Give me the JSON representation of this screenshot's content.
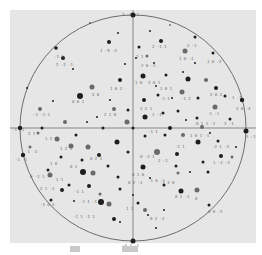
{
  "figure": {
    "panel": {
      "x": 10,
      "y": 10,
      "width": 246,
      "height": 233,
      "fill": "#e6e6e6"
    },
    "circle": {
      "cx": 133,
      "cy": 128,
      "r": 113,
      "stroke": "#6e6e6e"
    },
    "axes": {
      "stroke": "#6e6e6e",
      "horizontal_y": 128,
      "vertical_x": 133
    },
    "colors": {
      "dark_point": "#1e1e1e",
      "gray_point": "#6a6a6a",
      "label": "#6a6a6a"
    },
    "cardinal_poles": [
      {
        "x": 133,
        "y": 15,
        "r": 2.5,
        "label": "2 -3 -1"
      },
      {
        "x": 133,
        "y": 241,
        "r": 2.5,
        "label": "-4 3 -1"
      },
      {
        "x": 20,
        "y": 128,
        "r": 2.2,
        "label": "-1 -1"
      },
      {
        "x": 246,
        "y": 131,
        "r": 2.5,
        "label": "3 -1"
      }
    ],
    "rim_poles": [
      {
        "x": 56,
        "y": 48,
        "r": 1.8
      },
      {
        "x": 195,
        "y": 37,
        "r": 1.5
      },
      {
        "x": 213,
        "y": 53,
        "r": 1.5
      },
      {
        "x": 242,
        "y": 100,
        "r": 2.2
      },
      {
        "x": 23,
        "y": 155,
        "r": 2.2
      },
      {
        "x": 51,
        "y": 200,
        "r": 1.5
      },
      {
        "x": 209,
        "y": 205,
        "r": 1.5
      },
      {
        "x": 27,
        "y": 88,
        "r": 1.0
      },
      {
        "x": 90,
        "y": 23,
        "r": 0.8
      },
      {
        "x": 170,
        "y": 25,
        "r": 0.8
      }
    ],
    "points": [
      {
        "x": 109,
        "y": 42,
        "r": 2,
        "c": "d"
      },
      {
        "x": 118,
        "y": 33,
        "r": 1,
        "c": "d"
      },
      {
        "x": 150,
        "y": 31,
        "r": 1,
        "c": "d"
      },
      {
        "x": 161,
        "y": 41,
        "r": 2,
        "c": "d"
      },
      {
        "x": 139,
        "y": 47,
        "r": 1.5,
        "c": "d"
      },
      {
        "x": 147,
        "y": 56,
        "r": 1.5,
        "c": "g"
      },
      {
        "x": 185,
        "y": 51,
        "r": 2.5,
        "c": "g"
      },
      {
        "x": 63,
        "y": 58,
        "r": 2,
        "c": "d"
      },
      {
        "x": 73,
        "y": 69,
        "r": 1,
        "c": "d"
      },
      {
        "x": 143,
        "y": 76,
        "r": 2.5,
        "c": "d"
      },
      {
        "x": 120,
        "y": 80,
        "r": 2,
        "c": "d"
      },
      {
        "x": 92,
        "y": 87,
        "r": 2.5,
        "c": "g"
      },
      {
        "x": 80,
        "y": 96,
        "r": 3,
        "c": "d"
      },
      {
        "x": 166,
        "y": 75,
        "r": 1.5,
        "c": "d"
      },
      {
        "x": 183,
        "y": 72,
        "r": 1,
        "c": "d"
      },
      {
        "x": 188,
        "y": 79,
        "r": 2.5,
        "c": "d"
      },
      {
        "x": 206,
        "y": 80,
        "r": 2,
        "c": "g"
      },
      {
        "x": 216,
        "y": 88,
        "r": 2,
        "c": "d"
      },
      {
        "x": 182,
        "y": 92,
        "r": 2.5,
        "c": "g"
      },
      {
        "x": 198,
        "y": 98,
        "r": 1.5,
        "c": "d"
      },
      {
        "x": 225,
        "y": 96,
        "r": 1.5,
        "c": "d"
      },
      {
        "x": 144,
        "y": 100,
        "r": 2,
        "c": "d"
      },
      {
        "x": 158,
        "y": 95,
        "r": 1.5,
        "c": "d"
      },
      {
        "x": 172,
        "y": 98,
        "r": 1,
        "c": "d"
      },
      {
        "x": 40,
        "y": 109,
        "r": 2,
        "c": "g"
      },
      {
        "x": 53,
        "y": 101,
        "r": 1,
        "c": "d"
      },
      {
        "x": 114,
        "y": 109,
        "r": 2,
        "c": "g"
      },
      {
        "x": 128,
        "y": 110,
        "r": 1.5,
        "c": "d"
      },
      {
        "x": 145,
        "y": 117,
        "r": 2.5,
        "c": "d"
      },
      {
        "x": 163,
        "y": 113,
        "r": 1.5,
        "c": "d"
      },
      {
        "x": 178,
        "y": 111,
        "r": 1.5,
        "c": "d"
      },
      {
        "x": 197,
        "y": 118,
        "r": 1.5,
        "c": "d"
      },
      {
        "x": 215,
        "y": 107,
        "r": 2.5,
        "c": "g"
      },
      {
        "x": 230,
        "y": 119,
        "r": 1.5,
        "c": "d"
      },
      {
        "x": 65,
        "y": 122,
        "r": 2,
        "c": "g"
      },
      {
        "x": 87,
        "y": 122,
        "r": 1,
        "c": "d"
      },
      {
        "x": 127,
        "y": 122,
        "r": 2.5,
        "c": "g"
      },
      {
        "x": 42,
        "y": 128,
        "r": 1.5,
        "c": "d"
      },
      {
        "x": 103,
        "y": 128,
        "r": 1.5,
        "c": "d"
      },
      {
        "x": 133,
        "y": 128,
        "r": 1.5,
        "c": "d"
      },
      {
        "x": 170,
        "y": 128,
        "r": 2,
        "c": "d"
      },
      {
        "x": 202,
        "y": 127,
        "r": 2,
        "c": "g"
      },
      {
        "x": 38,
        "y": 133,
        "r": 1.5,
        "c": "g"
      },
      {
        "x": 57,
        "y": 139,
        "r": 2.5,
        "c": "g"
      },
      {
        "x": 76,
        "y": 135,
        "r": 1.5,
        "c": "d"
      },
      {
        "x": 117,
        "y": 142,
        "r": 2.5,
        "c": "d"
      },
      {
        "x": 145,
        "y": 136,
        "r": 1.5,
        "c": "d"
      },
      {
        "x": 165,
        "y": 135,
        "r": 1.5,
        "c": "d"
      },
      {
        "x": 183,
        "y": 135,
        "r": 2,
        "c": "g"
      },
      {
        "x": 198,
        "y": 142,
        "r": 2.5,
        "c": "d"
      },
      {
        "x": 218,
        "y": 141,
        "r": 1.5,
        "c": "d"
      },
      {
        "x": 30,
        "y": 147,
        "r": 1.5,
        "c": "g"
      },
      {
        "x": 71,
        "y": 146,
        "r": 2.5,
        "c": "g"
      },
      {
        "x": 88,
        "y": 147,
        "r": 2.5,
        "c": "g"
      },
      {
        "x": 99,
        "y": 155,
        "r": 2,
        "c": "d"
      },
      {
        "x": 128,
        "y": 152,
        "r": 1.5,
        "c": "d"
      },
      {
        "x": 157,
        "y": 152,
        "r": 3,
        "c": "g"
      },
      {
        "x": 177,
        "y": 154,
        "r": 2,
        "c": "d"
      },
      {
        "x": 221,
        "y": 156,
        "r": 2,
        "c": "d"
      },
      {
        "x": 232,
        "y": 157,
        "r": 1.5,
        "c": "g"
      },
      {
        "x": 61,
        "y": 157,
        "r": 1.5,
        "c": "d"
      },
      {
        "x": 82,
        "y": 160,
        "r": 1.5,
        "c": "d"
      },
      {
        "x": 48,
        "y": 170,
        "r": 1.5,
        "c": "d"
      },
      {
        "x": 108,
        "y": 166,
        "r": 1.5,
        "c": "d"
      },
      {
        "x": 143,
        "y": 167,
        "r": 2.5,
        "c": "d"
      },
      {
        "x": 176,
        "y": 166,
        "r": 1.5,
        "c": "d"
      },
      {
        "x": 203,
        "y": 162,
        "r": 1.5,
        "c": "d"
      },
      {
        "x": 50,
        "y": 175,
        "r": 2.5,
        "c": "g"
      },
      {
        "x": 83,
        "y": 172,
        "r": 3,
        "c": "d"
      },
      {
        "x": 93,
        "y": 173,
        "r": 2.5,
        "c": "g"
      },
      {
        "x": 118,
        "y": 177,
        "r": 1.5,
        "c": "d"
      },
      {
        "x": 178,
        "y": 173,
        "r": 1.5,
        "c": "g"
      },
      {
        "x": 190,
        "y": 172,
        "r": 1,
        "c": "d"
      },
      {
        "x": 208,
        "y": 172,
        "r": 1.5,
        "c": "d"
      },
      {
        "x": 69,
        "y": 185,
        "r": 1.5,
        "c": "d"
      },
      {
        "x": 89,
        "y": 186,
        "r": 2,
        "c": "d"
      },
      {
        "x": 62,
        "y": 190,
        "r": 2,
        "c": "d"
      },
      {
        "x": 100,
        "y": 194,
        "r": 1.5,
        "c": "g"
      },
      {
        "x": 120,
        "y": 189,
        "r": 1.5,
        "c": "d"
      },
      {
        "x": 164,
        "y": 185,
        "r": 1.5,
        "c": "d"
      },
      {
        "x": 181,
        "y": 191,
        "r": 2.5,
        "c": "d"
      },
      {
        "x": 197,
        "y": 190,
        "r": 2.5,
        "c": "g"
      },
      {
        "x": 101,
        "y": 202,
        "r": 3,
        "c": "d"
      },
      {
        "x": 109,
        "y": 204,
        "r": 2.5,
        "c": "g"
      },
      {
        "x": 138,
        "y": 203,
        "r": 1.5,
        "c": "d"
      },
      {
        "x": 145,
        "y": 210,
        "r": 2,
        "c": "g"
      },
      {
        "x": 114,
        "y": 219,
        "r": 2,
        "c": "d"
      },
      {
        "x": 120,
        "y": 222,
        "r": 1,
        "c": "d"
      },
      {
        "x": 148,
        "y": 215,
        "r": 1,
        "c": "d"
      },
      {
        "x": 164,
        "y": 210,
        "r": 1,
        "c": "d"
      },
      {
        "x": 136,
        "y": 58,
        "r": 1,
        "c": "d"
      },
      {
        "x": 125,
        "y": 64,
        "r": 1,
        "c": "d"
      },
      {
        "x": 154,
        "y": 63,
        "r": 1,
        "c": "d"
      },
      {
        "x": 195,
        "y": 63,
        "r": 1,
        "c": "d"
      },
      {
        "x": 156,
        "y": 86,
        "r": 1,
        "c": "d"
      },
      {
        "x": 110,
        "y": 100,
        "r": 1,
        "c": "d"
      },
      {
        "x": 97,
        "y": 117,
        "r": 1,
        "c": "d"
      },
      {
        "x": 186,
        "y": 120,
        "r": 1,
        "c": "d"
      },
      {
        "x": 210,
        "y": 133,
        "r": 1,
        "c": "d"
      },
      {
        "x": 236,
        "y": 147,
        "r": 1,
        "c": "d"
      },
      {
        "x": 150,
        "y": 178,
        "r": 1,
        "c": "d"
      },
      {
        "x": 133,
        "y": 195,
        "r": 1,
        "c": "d"
      },
      {
        "x": 74,
        "y": 201,
        "r": 1,
        "c": "d"
      },
      {
        "x": 156,
        "y": 228,
        "r": 1,
        "c": "d"
      }
    ],
    "labels": [
      {
        "x": 122,
        "y": 16,
        "t": "2 -3 -1"
      },
      {
        "x": 100,
        "y": 52,
        "t": "1 -5 -2"
      },
      {
        "x": 152,
        "y": 48,
        "t": "2 -1 1"
      },
      {
        "x": 187,
        "y": 47,
        "t": "2 -1"
      },
      {
        "x": 179,
        "y": 60,
        "t": "1 0 -1"
      },
      {
        "x": 207,
        "y": 63,
        "t": "1 0 -2"
      },
      {
        "x": 54,
        "y": 58,
        "t": "-1 1"
      },
      {
        "x": 56,
        "y": 66,
        "t": "2 -2 -1"
      },
      {
        "x": 136,
        "y": 58,
        "t": "2 1"
      },
      {
        "x": 141,
        "y": 67,
        "t": "2 0 -1"
      },
      {
        "x": 110,
        "y": 90,
        "t": "1 0 2"
      },
      {
        "x": 92,
        "y": 96,
        "t": "2 0"
      },
      {
        "x": 72,
        "y": 103,
        "t": "0 0 1"
      },
      {
        "x": 135,
        "y": 84,
        "t": "1 0"
      },
      {
        "x": 148,
        "y": 84,
        "t": "2 0 1"
      },
      {
        "x": 160,
        "y": 90,
        "t": "1 0 1"
      },
      {
        "x": 210,
        "y": 96,
        "t": "2 0 2"
      },
      {
        "x": 232,
        "y": 99,
        "t": "1 -1"
      },
      {
        "x": 236,
        "y": 110,
        "t": "2 0 -4"
      },
      {
        "x": 160,
        "y": 100,
        "t": "-1 1"
      },
      {
        "x": 181,
        "y": 100,
        "t": "-1 2"
      },
      {
        "x": 33,
        "y": 116,
        "t": "-1 -1 1"
      },
      {
        "x": 104,
        "y": 116,
        "t": "2 1 0"
      },
      {
        "x": 140,
        "y": 110,
        "t": "2 2 1"
      },
      {
        "x": 152,
        "y": 116,
        "t": "1 -1"
      },
      {
        "x": 207,
        "y": 115,
        "t": "-1 -1"
      },
      {
        "x": 196,
        "y": 125,
        "t": "0 1 1 -1"
      },
      {
        "x": 224,
        "y": 125,
        "t": "3 -1"
      },
      {
        "x": 246,
        "y": 138,
        "t": "3 -1"
      },
      {
        "x": 12,
        "y": 131,
        "t": "-1 -1"
      },
      {
        "x": 28,
        "y": 135,
        "t": "2 1"
      },
      {
        "x": 45,
        "y": 140,
        "t": "1 2 1"
      },
      {
        "x": 148,
        "y": 133,
        "t": "-1 1"
      },
      {
        "x": 190,
        "y": 137,
        "t": "1 0 1 -1"
      },
      {
        "x": 212,
        "y": 148,
        "t": "-2 1 -3"
      },
      {
        "x": 175,
        "y": 148,
        "t": "-1 1"
      },
      {
        "x": 25,
        "y": 153,
        "t": "-1 -2"
      },
      {
        "x": 15,
        "y": 161,
        "t": "-1 -1"
      },
      {
        "x": 60,
        "y": 150,
        "t": "1 2 1"
      },
      {
        "x": 90,
        "y": 160,
        "t": "0 2 1"
      },
      {
        "x": 140,
        "y": 158,
        "t": "0 -2 1"
      },
      {
        "x": 158,
        "y": 162,
        "t": "2 -1"
      },
      {
        "x": 213,
        "y": 164,
        "t": "1 -1 -2"
      },
      {
        "x": 50,
        "y": 165,
        "t": "1 0"
      },
      {
        "x": 70,
        "y": 168,
        "t": "0 1"
      },
      {
        "x": 30,
        "y": 178,
        "t": "0 -1 1"
      },
      {
        "x": 56,
        "y": 181,
        "t": "1 1"
      },
      {
        "x": 132,
        "y": 176,
        "t": "0 1 0"
      },
      {
        "x": 148,
        "y": 182,
        "t": "-1 0 -1"
      },
      {
        "x": 160,
        "y": 184,
        "t": "-1 2 0"
      },
      {
        "x": 40,
        "y": 190,
        "t": "2 1 -1"
      },
      {
        "x": 74,
        "y": 193,
        "t": "-1 1"
      },
      {
        "x": 128,
        "y": 184,
        "t": "0 2 -1"
      },
      {
        "x": 175,
        "y": 198,
        "t": "0 1 -1"
      },
      {
        "x": 195,
        "y": 200,
        "t": "0"
      },
      {
        "x": 40,
        "y": 206,
        "t": "-1 0 2"
      },
      {
        "x": 80,
        "y": 203,
        "t": "-1 1 -1"
      },
      {
        "x": 126,
        "y": 210,
        "t": "1 1"
      },
      {
        "x": 208,
        "y": 213,
        "t": "0 0 -2"
      },
      {
        "x": 150,
        "y": 220,
        "t": "0 2 -2"
      },
      {
        "x": 73,
        "y": 218,
        "t": "-1 1 -2 1"
      },
      {
        "x": 122,
        "y": 247,
        "t": "-4 3 -1"
      }
    ]
  },
  "caption": {
    "marks": [
      {
        "x": 70,
        "width": 10
      },
      {
        "x": 122,
        "width": 16
      }
    ]
  }
}
